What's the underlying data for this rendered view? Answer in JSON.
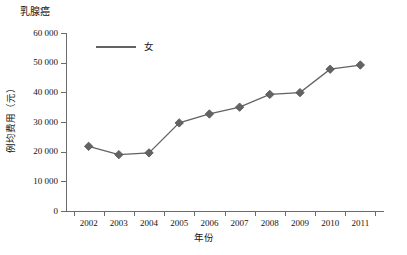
{
  "chart_data": {
    "type": "line",
    "title": "乳腺癌",
    "xlabel": "年份",
    "ylabel": "例均费用（元）",
    "categories": [
      "2002",
      "2003",
      "2004",
      "2005",
      "2006",
      "2007",
      "2008",
      "2009",
      "2010",
      "2011"
    ],
    "series": [
      {
        "name": "女",
        "values": [
          21800,
          19000,
          19600,
          29700,
          32700,
          35000,
          39300,
          39900,
          47800,
          49200
        ]
      }
    ],
    "ylim": [
      0,
      60000
    ],
    "y_ticks": [
      0,
      10000,
      20000,
      30000,
      40000,
      50000,
      60000
    ],
    "y_tick_labels": [
      "0",
      "10 000",
      "20 000",
      "30 000",
      "40 000",
      "50 000",
      "60 000"
    ],
    "grid": false,
    "legend_position": "top-left-inside",
    "marker": "diamond",
    "series_color": "#636363",
    "axis_color": "#6b6b6b"
  }
}
